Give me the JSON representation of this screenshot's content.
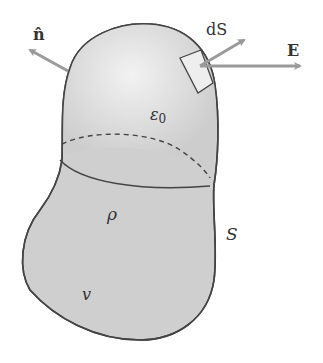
{
  "diagram": {
    "type": "gaussian-surface",
    "labels": {
      "normal": "n̂",
      "area_element": "dS",
      "field": "E",
      "permittivity": "ε",
      "permittivity_sub": "0",
      "charge_density": "ρ",
      "surface": "S",
      "volume": "v"
    },
    "colors": {
      "fill": "#cfcfcf",
      "highlight": "#efefef",
      "outline": "#444444",
      "arrow": "#9a9a9a",
      "patch": "#eeeeee"
    }
  }
}
